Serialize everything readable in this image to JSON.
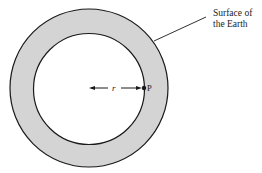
{
  "diagram": {
    "surface_label_line1": "Surface of",
    "surface_label_line2": "the Earth",
    "radius_label": "r",
    "point_label": "P",
    "colors": {
      "shell_fill": "#d4d4d4",
      "stroke": "#1a1a1a",
      "background": "#ffffff"
    }
  }
}
